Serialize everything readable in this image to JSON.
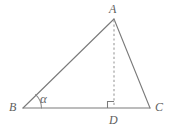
{
  "figure": {
    "name": "triangle-with-altitude",
    "background_color": "#ffffff",
    "stroke_color": "#7a7a7a",
    "dashed_stroke_color": "#9a9a9a",
    "label_color": "#5e5e5e",
    "labels": {
      "apex": "A",
      "left_base": "B",
      "right_base": "C",
      "foot_of_altitude": "D",
      "angle_at_b": "α"
    },
    "points": {
      "A": {
        "x": 114,
        "y": 19
      },
      "B": {
        "x": 23,
        "y": 108
      },
      "C": {
        "x": 150,
        "y": 108
      },
      "D": {
        "x": 114,
        "y": 108
      }
    },
    "segments": [
      {
        "name": "side-AB",
        "from": "A",
        "to": "B",
        "style": "solid"
      },
      {
        "name": "side-AC",
        "from": "A",
        "to": "C",
        "style": "solid"
      },
      {
        "name": "side-BC",
        "from": "B",
        "to": "C",
        "style": "solid"
      },
      {
        "name": "altitude-AD",
        "from": "A",
        "to": "D",
        "style": "dashed"
      }
    ],
    "markers": {
      "right_angle_at_d": true,
      "angle_arc_at_b": true
    }
  }
}
